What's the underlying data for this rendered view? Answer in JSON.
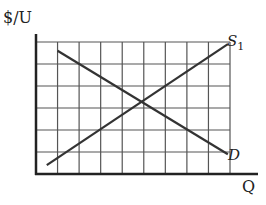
{
  "chart_data": {
    "type": "line",
    "title": "",
    "xlabel": "Q",
    "ylabel": "$/U",
    "grid": true,
    "grid_cols": 9,
    "grid_rows": 6,
    "xlim": [
      0,
      9
    ],
    "ylim": [
      0,
      6
    ],
    "series": [
      {
        "name": "S1",
        "label": "S",
        "subscript": "1",
        "x": [
          0.5,
          8.9
        ],
        "y": [
          0.4,
          5.9
        ]
      },
      {
        "name": "D",
        "label": "D",
        "x": [
          1.0,
          8.9
        ],
        "y": [
          5.6,
          0.9
        ]
      }
    ],
    "intersection": {
      "x": 4.8,
      "y": 3.2
    }
  },
  "labels": {
    "ylabel": "$/U",
    "xlabel": "Q",
    "supply": "S",
    "supply_sub": "1",
    "demand": "D"
  }
}
